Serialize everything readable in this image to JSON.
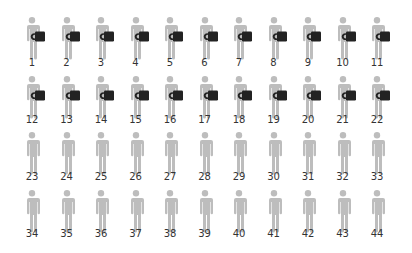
{
  "colors": {
    "figure": "#bdbdbd",
    "mug": "#222222",
    "label": "#333333",
    "background": "#ffffff"
  },
  "layout": {
    "columns": 11,
    "col_start_center_x": 32,
    "col_spacing": 34.5,
    "row_head_top_y": [
      17,
      76,
      132,
      190
    ],
    "row_label_y": [
      57,
      114,
      171,
      228
    ]
  },
  "people": [
    {
      "n": "1",
      "mug": true
    },
    {
      "n": "2",
      "mug": true
    },
    {
      "n": "3",
      "mug": true
    },
    {
      "n": "4",
      "mug": true
    },
    {
      "n": "5",
      "mug": true
    },
    {
      "n": "6",
      "mug": true
    },
    {
      "n": "7",
      "mug": true
    },
    {
      "n": "8",
      "mug": true
    },
    {
      "n": "9",
      "mug": true
    },
    {
      "n": "10",
      "mug": true
    },
    {
      "n": "11",
      "mug": true
    },
    {
      "n": "12",
      "mug": true
    },
    {
      "n": "13",
      "mug": true
    },
    {
      "n": "14",
      "mug": true
    },
    {
      "n": "15",
      "mug": true
    },
    {
      "n": "16",
      "mug": true
    },
    {
      "n": "17",
      "mug": true
    },
    {
      "n": "18",
      "mug": true
    },
    {
      "n": "19",
      "mug": true
    },
    {
      "n": "20",
      "mug": true
    },
    {
      "n": "21",
      "mug": true
    },
    {
      "n": "22",
      "mug": true
    },
    {
      "n": "23",
      "mug": false
    },
    {
      "n": "24",
      "mug": false
    },
    {
      "n": "25",
      "mug": false
    },
    {
      "n": "26",
      "mug": false
    },
    {
      "n": "27",
      "mug": false
    },
    {
      "n": "28",
      "mug": false
    },
    {
      "n": "29",
      "mug": false
    },
    {
      "n": "30",
      "mug": false
    },
    {
      "n": "31",
      "mug": false
    },
    {
      "n": "32",
      "mug": false
    },
    {
      "n": "33",
      "mug": false
    },
    {
      "n": "34",
      "mug": false
    },
    {
      "n": "35",
      "mug": false
    },
    {
      "n": "36",
      "mug": false
    },
    {
      "n": "37",
      "mug": false
    },
    {
      "n": "38",
      "mug": false
    },
    {
      "n": "39",
      "mug": false
    },
    {
      "n": "40",
      "mug": false
    },
    {
      "n": "41",
      "mug": false
    },
    {
      "n": "42",
      "mug": false
    },
    {
      "n": "43",
      "mug": false
    },
    {
      "n": "44",
      "mug": false
    }
  ],
  "summary": {
    "total_people": 44,
    "with_mug": 22,
    "without_mug": 22
  }
}
